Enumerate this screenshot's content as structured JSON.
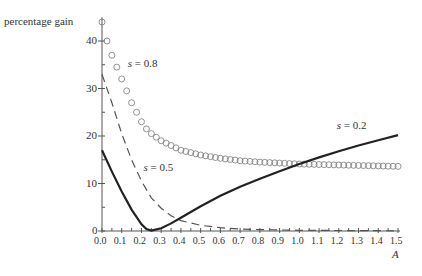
{
  "chart_data": {
    "type": "line",
    "title": "",
    "xlabel": "A",
    "ylabel": "percentage gain",
    "xlim": [
      0,
      1.5
    ],
    "ylim": [
      0,
      45
    ],
    "x_ticks": [
      "0.0",
      "0.1",
      "0.2",
      "0.3",
      "0.4",
      "0.5",
      "0.6",
      "0.7",
      "0.8",
      "0.9",
      "1.0",
      "1.1",
      "1.2",
      "1.3",
      "1.4",
      "1.5"
    ],
    "y_ticks": [
      "0",
      "10",
      "20",
      "30",
      "40"
    ],
    "grid": false,
    "series": [
      {
        "name": "s = 0.8",
        "style": "circles",
        "x": [
          0.0,
          0.025,
          0.05,
          0.075,
          0.1,
          0.125,
          0.15,
          0.175,
          0.2,
          0.225,
          0.25,
          0.3,
          0.35,
          0.4,
          0.5,
          0.6,
          0.7,
          0.8,
          0.9,
          1.0,
          1.1,
          1.2,
          1.3,
          1.4,
          1.5
        ],
        "values": [
          44,
          40,
          37,
          34.5,
          32,
          29.5,
          27,
          25,
          23,
          21.5,
          20.5,
          19,
          18,
          17,
          16,
          15.3,
          14.8,
          14.5,
          14.3,
          14.1,
          14.0,
          13.9,
          13.8,
          13.7,
          13.6
        ]
      },
      {
        "name": "s = 0.5",
        "style": "dashed",
        "x": [
          0.0,
          0.05,
          0.1,
          0.15,
          0.2,
          0.25,
          0.3,
          0.35,
          0.4,
          0.5,
          0.6,
          0.7,
          0.8,
          1.0,
          1.2,
          1.5
        ],
        "values": [
          33,
          27,
          20.5,
          15,
          10.5,
          7,
          4.8,
          3.2,
          2.2,
          1.2,
          0.7,
          0.4,
          0.3,
          0.15,
          0.1,
          0.05
        ]
      },
      {
        "name": "s = 0.2",
        "style": "solid",
        "x": [
          0.0,
          0.05,
          0.1,
          0.15,
          0.2,
          0.225,
          0.25,
          0.3,
          0.35,
          0.4,
          0.5,
          0.6,
          0.7,
          0.8,
          0.9,
          1.0,
          1.1,
          1.2,
          1.3,
          1.4,
          1.5
        ],
        "values": [
          17,
          12.5,
          8.3,
          4.5,
          1.4,
          0.4,
          0.1,
          0.6,
          1.6,
          2.8,
          5.2,
          7.4,
          9.3,
          11.0,
          12.6,
          14.1,
          15.5,
          16.8,
          18.0,
          19.1,
          20.2
        ]
      }
    ],
    "annotations": [
      {
        "text": "s = 0.8",
        "x": 0.13,
        "y": 35
      },
      {
        "text": "s = 0.5",
        "x": 0.21,
        "y": 13
      },
      {
        "text": "s = 0.2",
        "x": 1.19,
        "y": 22
      }
    ]
  }
}
